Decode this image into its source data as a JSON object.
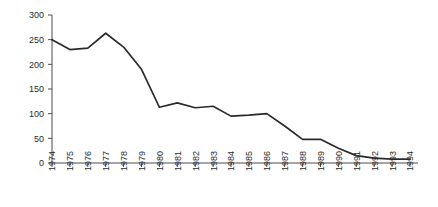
{
  "chart_data": {
    "type": "line",
    "title": "",
    "subtitle": "",
    "xlabel": "",
    "ylabel": "",
    "categories": [
      "1974",
      "1975",
      "1976",
      "1977",
      "1978",
      "1979",
      "1980",
      "1981",
      "1982",
      "1983",
      "1984",
      "1985",
      "1986",
      "1987",
      "1988",
      "1989",
      "1990",
      "1991",
      "1992",
      "1993",
      "1994"
    ],
    "values": [
      250,
      230,
      233,
      263,
      235,
      190,
      113,
      122,
      112,
      115,
      95,
      97,
      100,
      75,
      48,
      48,
      30,
      15,
      10,
      8,
      8
    ],
    "ylim": [
      0,
      300
    ],
    "ytick_values": [
      0,
      50,
      100,
      150,
      200,
      250,
      300
    ],
    "ytick_labels": [
      "0",
      "50",
      "100",
      "150",
      "200",
      "250",
      "300"
    ],
    "grid": false,
    "legend": null,
    "legend_position": "none",
    "series_color": "#2a2a2a",
    "axis_color": "#4d4d4d",
    "background_color": "#ffffff",
    "x_tick_label_rotation": -90
  }
}
